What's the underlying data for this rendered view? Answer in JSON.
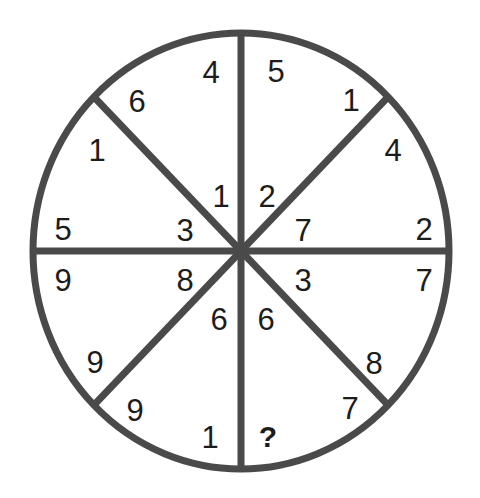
{
  "figure": {
    "shape": "circle",
    "stroke_color": "#4a4a4a",
    "fill_color": "#ffffff",
    "text_color": "#1c1c1c",
    "stroke_width": 7,
    "center_x": 241,
    "center_y": 251,
    "radius_x": 208,
    "radius_y": 218,
    "divider_count": 4,
    "sector_count": 8,
    "dividers": [
      {
        "name": "vertical-divider",
        "angle_deg": 90
      },
      {
        "name": "horizontal-divider",
        "angle_deg": 0
      },
      {
        "name": "diagonal-divider-nw-se",
        "angle_deg": 135
      },
      {
        "name": "diagonal-divider-ne-sw",
        "angle_deg": 45
      }
    ]
  },
  "labels": [
    {
      "id": "label-1",
      "text": "4",
      "x": 211,
      "y": 72
    },
    {
      "id": "label-2",
      "text": "5",
      "x": 276,
      "y": 71
    },
    {
      "id": "label-3",
      "text": "6",
      "x": 137,
      "y": 101
    },
    {
      "id": "label-4",
      "text": "1",
      "x": 351,
      "y": 100
    },
    {
      "id": "label-5",
      "text": "1",
      "x": 97,
      "y": 150
    },
    {
      "id": "label-6",
      "text": "4",
      "x": 393,
      "y": 150
    },
    {
      "id": "label-7",
      "text": "1",
      "x": 221,
      "y": 196
    },
    {
      "id": "label-8",
      "text": "2",
      "x": 267,
      "y": 196
    },
    {
      "id": "label-9",
      "text": "5",
      "x": 63,
      "y": 229
    },
    {
      "id": "label-10",
      "text": "3",
      "x": 185,
      "y": 230
    },
    {
      "id": "label-11",
      "text": "7",
      "x": 303,
      "y": 230
    },
    {
      "id": "label-12",
      "text": "2",
      "x": 424,
      "y": 229
    },
    {
      "id": "label-13",
      "text": "9",
      "x": 63,
      "y": 280
    },
    {
      "id": "label-14",
      "text": "8",
      "x": 185,
      "y": 280
    },
    {
      "id": "label-15",
      "text": "3",
      "x": 303,
      "y": 280
    },
    {
      "id": "label-16",
      "text": "7",
      "x": 424,
      "y": 280
    },
    {
      "id": "label-17",
      "text": "6",
      "x": 219,
      "y": 319
    },
    {
      "id": "label-18",
      "text": "6",
      "x": 266,
      "y": 319
    },
    {
      "id": "label-19",
      "text": "9",
      "x": 95,
      "y": 362
    },
    {
      "id": "label-20",
      "text": "8",
      "x": 374,
      "y": 363
    },
    {
      "id": "label-21",
      "text": "9",
      "x": 135,
      "y": 410
    },
    {
      "id": "label-22",
      "text": "7",
      "x": 350,
      "y": 408
    },
    {
      "id": "label-23",
      "text": "1",
      "x": 210,
      "y": 437
    },
    {
      "id": "label-24",
      "text": "?",
      "x": 268,
      "y": 437,
      "bold": true
    }
  ],
  "sectors": [
    {
      "name": "sector-top-right",
      "from_deg": 67.5,
      "to_deg": 112.5,
      "numbers": [
        "4",
        "5"
      ]
    },
    {
      "name": "sector-upper-right",
      "from_deg": 22.5,
      "to_deg": 67.5,
      "numbers": [
        "1",
        "4"
      ]
    },
    {
      "name": "sector-right",
      "from_deg": -22.5,
      "to_deg": 22.5,
      "numbers": [
        "2",
        "7"
      ]
    },
    {
      "name": "sector-lower-right",
      "from_deg": -67.5,
      "to_deg": -22.5,
      "numbers": [
        "3",
        "7"
      ]
    },
    {
      "name": "sector-bottom-right",
      "from_deg": -112.5,
      "to_deg": -67.5,
      "numbers": [
        "8",
        "7"
      ]
    },
    {
      "name": "sector-bottom-left",
      "from_deg": -157.5,
      "to_deg": -112.5,
      "numbers": [
        "6",
        "?"
      ]
    },
    {
      "name": "sector-lower-left",
      "from_deg": 157.5,
      "to_deg": -157.5,
      "numbers": [
        "9",
        "9"
      ]
    },
    {
      "name": "sector-upper-left",
      "from_deg": 112.5,
      "to_deg": 157.5,
      "numbers": [
        "6",
        "1"
      ]
    }
  ],
  "puzzle": {
    "missing_marker": "?",
    "sequence_reading_clockwise": [
      "5",
      "1",
      "4",
      "2",
      "7",
      "3",
      "8",
      "7",
      "?",
      "6",
      "9",
      "9",
      "1",
      "5",
      "6",
      "4"
    ]
  }
}
